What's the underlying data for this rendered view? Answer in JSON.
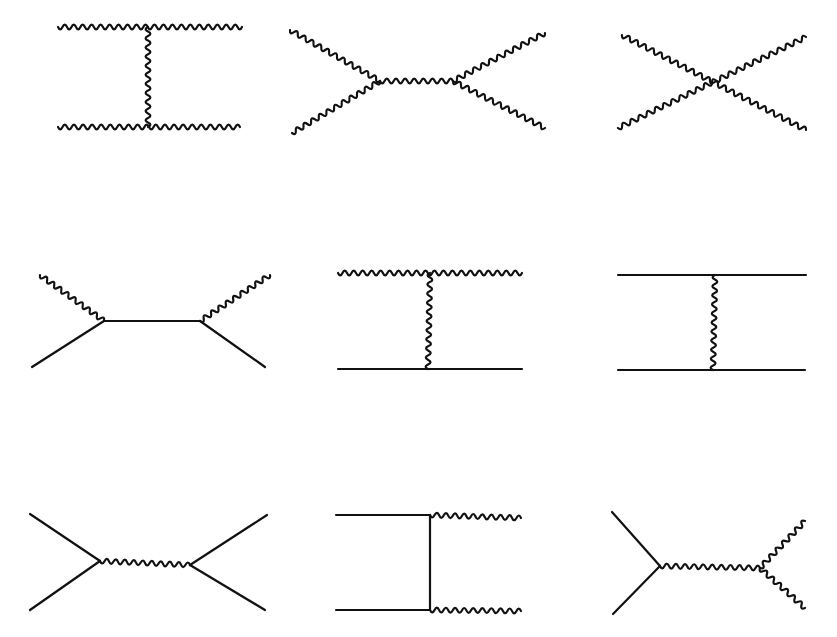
{
  "page": {
    "background": "#ffffff",
    "ink_color": "#111111",
    "running_header": {
      "text": "",
      "page_number": "",
      "note_clipped": true
    }
  },
  "figure": {
    "diagrams": [
      {
        "id": "d1",
        "label": "t-channel boson exchange, all external bosons",
        "lines": [
          {
            "type": "wavy",
            "from": [
              58,
              27
            ],
            "to": [
              242,
              27
            ]
          },
          {
            "type": "wavy",
            "from": [
              58,
              127
            ],
            "to": [
              240,
              127
            ]
          },
          {
            "type": "wavy",
            "from": [
              148,
              27
            ],
            "to": [
              148,
              127
            ]
          }
        ]
      },
      {
        "id": "d2",
        "label": "s-channel boson exchange, all external bosons",
        "lines": [
          {
            "type": "wavy",
            "from": [
              290,
              30
            ],
            "to": [
              380,
              81
            ]
          },
          {
            "type": "wavy",
            "from": [
              292,
              133
            ],
            "to": [
              380,
              81
            ]
          },
          {
            "type": "wavy",
            "from": [
              380,
              81
            ],
            "to": [
              453,
              81
            ]
          },
          {
            "type": "wavy",
            "from": [
              453,
              81
            ],
            "to": [
              545,
              33
            ]
          },
          {
            "type": "wavy",
            "from": [
              453,
              81
            ],
            "to": [
              545,
              128
            ]
          }
        ]
      },
      {
        "id": "d3",
        "label": "four-boson contact vertex",
        "lines": [
          {
            "type": "wavy",
            "from": [
              622,
              35
            ],
            "to": [
              806,
              130
            ]
          },
          {
            "type": "wavy",
            "from": [
              618,
              128
            ],
            "to": [
              806,
              37
            ]
          }
        ]
      },
      {
        "id": "d4",
        "label": "s-channel fermion propagator, boson and fermion legs",
        "lines": [
          {
            "type": "wavy",
            "from": [
              40,
              275
            ],
            "to": [
              104,
              321
            ]
          },
          {
            "type": "solid",
            "from": [
              32,
              367
            ],
            "to": [
              104,
              321
            ]
          },
          {
            "type": "solid",
            "from": [
              104,
              321
            ],
            "to": [
              200,
              321
            ]
          },
          {
            "type": "wavy",
            "from": [
              200,
              321
            ],
            "to": [
              270,
              275
            ]
          },
          {
            "type": "solid",
            "from": [
              200,
              321
            ],
            "to": [
              265,
              367
            ]
          }
        ]
      },
      {
        "id": "d5",
        "label": "t-channel boson exchange, boson on top, fermion on bottom",
        "lines": [
          {
            "type": "wavy",
            "from": [
              338,
              273
            ],
            "to": [
              522,
              273
            ]
          },
          {
            "type": "solid",
            "from": [
              338,
              369
            ],
            "to": [
              522,
              369
            ]
          },
          {
            "type": "wavy",
            "from": [
              430,
              273
            ],
            "to": [
              428,
              369
            ]
          }
        ]
      },
      {
        "id": "d6",
        "label": "t-channel boson exchange between two fermion lines",
        "lines": [
          {
            "type": "solid",
            "from": [
              618,
              275
            ],
            "to": [
              806,
              275
            ]
          },
          {
            "type": "solid",
            "from": [
              618,
              370
            ],
            "to": [
              805,
              370
            ]
          },
          {
            "type": "wavy",
            "from": [
              715,
              275
            ],
            "to": [
              713,
              370
            ]
          }
        ]
      },
      {
        "id": "d7",
        "label": "s-channel boson exchange between fermion pairs",
        "lines": [
          {
            "type": "solid",
            "from": [
              30,
              514
            ],
            "to": [
              100,
              561
            ]
          },
          {
            "type": "solid",
            "from": [
              30,
              610
            ],
            "to": [
              100,
              561
            ]
          },
          {
            "type": "wavy",
            "from": [
              100,
              561
            ],
            "to": [
              190,
              565
            ]
          },
          {
            "type": "solid",
            "from": [
              190,
              565
            ],
            "to": [
              267,
              515
            ]
          },
          {
            "type": "solid",
            "from": [
              190,
              565
            ],
            "to": [
              265,
              610
            ]
          }
        ]
      },
      {
        "id": "d8",
        "label": "t-channel fermion exchange, fermions in, bosons out",
        "lines": [
          {
            "type": "solid",
            "from": [
              336,
              515
            ],
            "to": [
              430,
              515
            ]
          },
          {
            "type": "solid",
            "from": [
              336,
              610
            ],
            "to": [
              430,
              610
            ]
          },
          {
            "type": "solid",
            "from": [
              430,
              515
            ],
            "to": [
              430,
              610
            ]
          },
          {
            "type": "wavy",
            "from": [
              430,
              515
            ],
            "to": [
              521,
              518
            ]
          },
          {
            "type": "wavy",
            "from": [
              430,
              610
            ],
            "to": [
              521,
              611
            ]
          }
        ]
      },
      {
        "id": "d9",
        "label": "s-channel boson into boson pair (triple gauge vertex)",
        "lines": [
          {
            "type": "solid",
            "from": [
              612,
              512
            ],
            "to": [
              660,
              566
            ]
          },
          {
            "type": "solid",
            "from": [
              613,
              614
            ],
            "to": [
              660,
              566
            ]
          },
          {
            "type": "wavy",
            "from": [
              660,
              566
            ],
            "to": [
              760,
              568
            ]
          },
          {
            "type": "wavy",
            "from": [
              760,
              568
            ],
            "to": [
              805,
              521
            ]
          },
          {
            "type": "wavy",
            "from": [
              760,
              568
            ],
            "to": [
              805,
              608
            ]
          }
        ]
      }
    ]
  },
  "wave": {
    "wavelength": 9,
    "amplitude": 2.4
  }
}
